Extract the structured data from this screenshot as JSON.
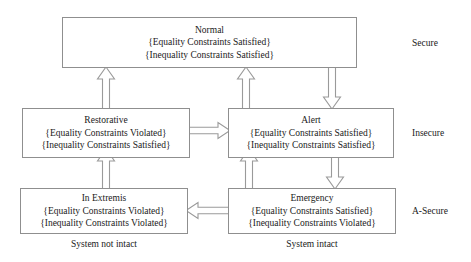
{
  "diagram": {
    "colors": {
      "box_border": "#8f8f8f",
      "arrow_stroke": "#9a9a9a",
      "arrow_fill": "#ffffff",
      "text": "#1a1a1a",
      "background": "#ffffff"
    },
    "states": [
      {
        "id": "normal",
        "name": "Normal",
        "equality": "{Equality Constraints Satisfied}",
        "inequality": "{Inequality Constraints Satisfied}"
      },
      {
        "id": "restorative",
        "name": "Restorative",
        "equality": "{Equality Constraints Violated}",
        "inequality": "{Inequality Constraints Satisfied}"
      },
      {
        "id": "alert",
        "name": "Alert",
        "equality": "{Equality Constraints Satisfied}",
        "inequality": "{Inequality Constraints Satisfied}"
      },
      {
        "id": "in-extremis",
        "name": "In Extremis",
        "equality": "{Equality Constraints Violated}",
        "inequality": "{Inequality Constraints Violated}"
      },
      {
        "id": "emergency",
        "name": "Emergency",
        "equality": "{Equality Constraints Satisfied}",
        "inequality": "{Inequality Constraints Violated}"
      }
    ],
    "row_labels": [
      {
        "id": "secure",
        "label": "Secure"
      },
      {
        "id": "insecure",
        "label": "Insecure"
      },
      {
        "id": "a-secure",
        "label": "A-Secure"
      }
    ],
    "column_labels": [
      {
        "id": "not-intact",
        "label": "System not intact"
      },
      {
        "id": "intact",
        "label": "System intact"
      }
    ],
    "transitions": [
      {
        "id": "restorative-to-normal",
        "from": "Restorative",
        "to": "Normal",
        "direction": "up"
      },
      {
        "id": "alert-to-normal",
        "from": "Alert",
        "to": "Normal",
        "direction": "up"
      },
      {
        "id": "normal-to-alert",
        "from": "Normal",
        "to": "Alert",
        "direction": "down"
      },
      {
        "id": "restorative-to-alert",
        "from": "Restorative",
        "to": "Alert",
        "direction": "right"
      },
      {
        "id": "in-extremis-to-restorative",
        "from": "In Extremis",
        "to": "Restorative",
        "direction": "up"
      },
      {
        "id": "emergency-to-alert",
        "from": "Emergency",
        "to": "Alert",
        "direction": "up"
      },
      {
        "id": "alert-to-emergency",
        "from": "Alert",
        "to": "Emergency",
        "direction": "down"
      },
      {
        "id": "emergency-to-in-extremis",
        "from": "Emergency",
        "to": "In Extremis",
        "direction": "left"
      }
    ]
  }
}
